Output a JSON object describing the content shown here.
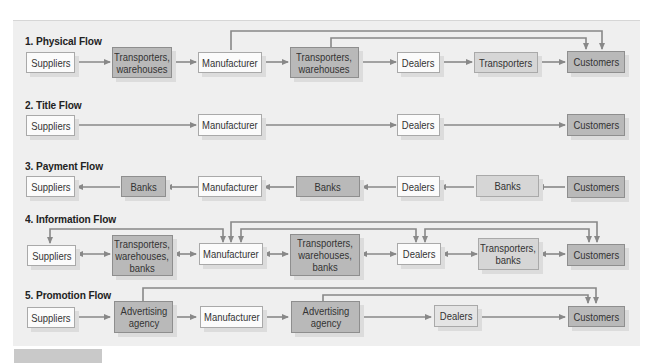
{
  "diagram": {
    "colors": {
      "panel": "#efefef",
      "light_box": "#fbfbfb",
      "dark_box": "#b9b9b9",
      "arrow": "#888888"
    },
    "flows": [
      {
        "title": "1. Physical Flow",
        "nodes": [
          "Suppliers",
          "Transporters,\nwarehouses",
          "Manufacturer",
          "Transporters,\nwarehouses",
          "Dealers",
          "Transporters",
          "Customers"
        ],
        "edges": [
          [
            "Suppliers",
            "Transporters, warehouses"
          ],
          [
            "Transporters, warehouses",
            "Manufacturer"
          ],
          [
            "Manufacturer",
            "Transporters, warehouses"
          ],
          [
            "Transporters, warehouses",
            "Dealers"
          ],
          [
            "Dealers",
            "Transporters"
          ],
          [
            "Transporters",
            "Customers"
          ],
          [
            "Manufacturer",
            "Customers"
          ],
          [
            "Transporters, warehouses",
            "Customers"
          ]
        ]
      },
      {
        "title": "2. Title Flow",
        "nodes": [
          "Suppliers",
          "Manufacturer",
          "Dealers",
          "Customers"
        ],
        "edges": [
          [
            "Suppliers",
            "Manufacturer"
          ],
          [
            "Manufacturer",
            "Dealers"
          ],
          [
            "Dealers",
            "Customers"
          ]
        ]
      },
      {
        "title": "3. Payment Flow",
        "nodes": [
          "Suppliers",
          "Banks",
          "Manufacturer",
          "Banks",
          "Dealers",
          "Banks",
          "Customers"
        ],
        "edges": [
          [
            "Customers",
            "Banks"
          ],
          [
            "Banks",
            "Dealers"
          ],
          [
            "Dealers",
            "Banks"
          ],
          [
            "Banks",
            "Manufacturer"
          ],
          [
            "Manufacturer",
            "Banks"
          ],
          [
            "Banks",
            "Suppliers"
          ]
        ]
      },
      {
        "title": "4. Information Flow",
        "nodes": [
          "Suppliers",
          "Transporters,\nwarehouses,\nbanks",
          "Manufacturer",
          "Transporters,\nwarehouses,\nbanks",
          "Dealers",
          "Transporters,\nbanks",
          "Customers"
        ],
        "edges": [
          [
            "Suppliers",
            "Transporters, warehouses, banks",
            "bidirectional"
          ],
          [
            "Transporters, warehouses, banks",
            "Manufacturer",
            "bidirectional"
          ],
          [
            "Manufacturer",
            "Transporters, warehouses, banks",
            "bidirectional"
          ],
          [
            "Transporters, warehouses, banks",
            "Dealers",
            "bidirectional"
          ],
          [
            "Dealers",
            "Transporters, banks",
            "bidirectional"
          ],
          [
            "Transporters, banks",
            "Customers",
            "bidirectional"
          ],
          [
            "Suppliers",
            "Manufacturer",
            "bidirectional"
          ],
          [
            "Manufacturer",
            "Customers",
            "bidirectional"
          ],
          [
            "Manufacturer",
            "Dealers",
            "bidirectional"
          ],
          [
            "Dealers",
            "Customers",
            "bidirectional"
          ]
        ]
      },
      {
        "title": "5. Promotion Flow",
        "nodes": [
          "Suppliers",
          "Advertising\nagency",
          "Manufacturer",
          "Advertising\nagency",
          "Dealers",
          "Customers"
        ],
        "edges": [
          [
            "Suppliers",
            "Advertising agency"
          ],
          [
            "Advertising agency",
            "Manufacturer"
          ],
          [
            "Manufacturer",
            "Advertising agency"
          ],
          [
            "Advertising agency",
            "Dealers"
          ],
          [
            "Dealers",
            "Customers"
          ],
          [
            "Advertising agency",
            "Customers"
          ],
          [
            "Advertising agency",
            "Customers"
          ]
        ]
      }
    ]
  }
}
